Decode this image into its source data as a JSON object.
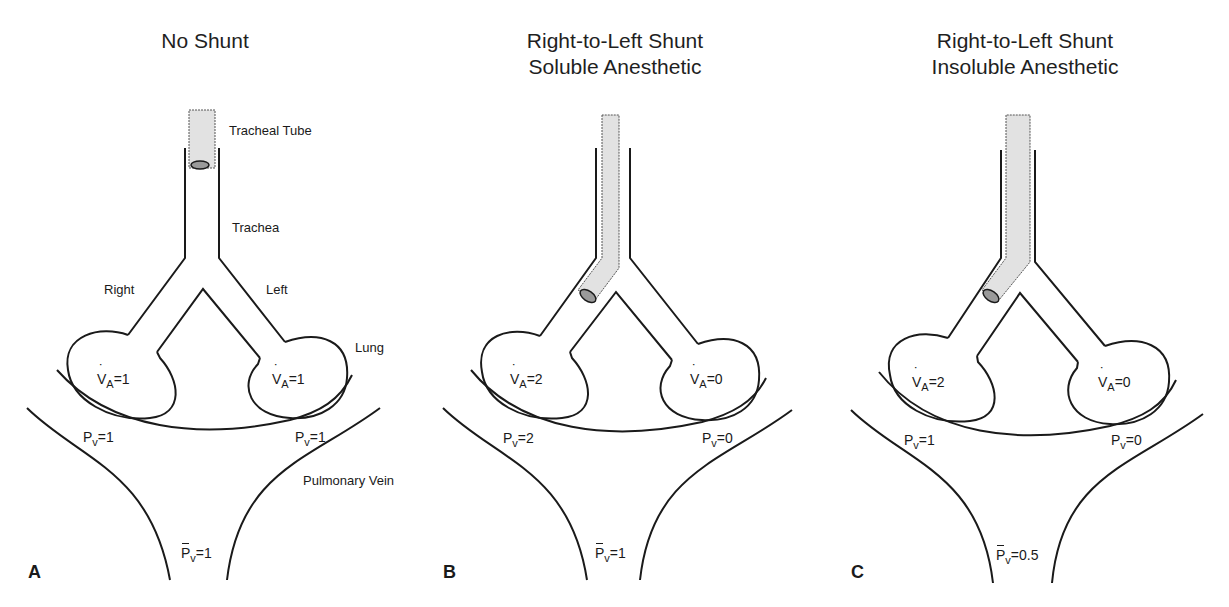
{
  "panels": [
    {
      "letter": "A",
      "title_line1": "No Shunt",
      "title_line2": "",
      "labels": {
        "tracheal_tube": "Tracheal Tube",
        "trachea": "Trachea",
        "right": "Right",
        "left": "Left",
        "lung": "Lung",
        "pulmonary_vein": "Pulmonary Vein"
      },
      "right_lung": {
        "symbol": "V",
        "sub": "A",
        "value": "=1"
      },
      "left_lung": {
        "symbol": "V",
        "sub": "A",
        "value": "=1"
      },
      "right_pv": {
        "symbol": "P",
        "sub": "v",
        "value": "=1"
      },
      "left_pv": {
        "symbol": "P",
        "sub": "v",
        "value": "=1"
      },
      "mixed_pv": {
        "symbol": "P",
        "sub": "v",
        "value": "=1"
      }
    },
    {
      "letter": "B",
      "title_line1": "Right-to-Left Shunt",
      "title_line2": "Soluble Anesthetic",
      "right_lung": {
        "symbol": "V",
        "sub": "A",
        "value": "=2"
      },
      "left_lung": {
        "symbol": "V",
        "sub": "A",
        "value": "=0"
      },
      "right_pv": {
        "symbol": "P",
        "sub": "v",
        "value": "=2"
      },
      "left_pv": {
        "symbol": "P",
        "sub": "v",
        "value": "=0"
      },
      "mixed_pv": {
        "symbol": "P",
        "sub": "v",
        "value": "=1"
      }
    },
    {
      "letter": "C",
      "title_line1": "Right-to-Left Shunt",
      "title_line2": "Insoluble Anesthetic",
      "right_lung": {
        "symbol": "V",
        "sub": "A",
        "value": "=2"
      },
      "left_lung": {
        "symbol": "V",
        "sub": "A",
        "value": "=0"
      },
      "right_pv": {
        "symbol": "P",
        "sub": "v",
        "value": "=1"
      },
      "left_pv": {
        "symbol": "P",
        "sub": "v",
        "value": "=0"
      },
      "mixed_pv": {
        "symbol": "P",
        "sub": "v",
        "value": "=0.5"
      }
    }
  ],
  "colors": {
    "line": "#1a1a1a",
    "tube_fill": "#e2e2e2",
    "cuff_fill": "#9a9a9a"
  }
}
